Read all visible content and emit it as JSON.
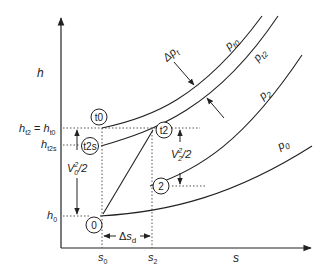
{
  "diagram": {
    "type": "h-s (enthalpy-entropy) diagram, diffuser process",
    "axes": {
      "y_label": "h",
      "x_label": "s"
    },
    "isobars": [
      {
        "id": "pt0",
        "label": "p",
        "sub": "t0"
      },
      {
        "id": "pt2",
        "label": "p",
        "sub": "t2"
      },
      {
        "id": "p2",
        "label": "p",
        "sub": "2"
      },
      {
        "id": "p0",
        "label": "p",
        "sub": "0"
      }
    ],
    "pressure_loss": {
      "label": "Δp",
      "sub": "t"
    },
    "states": [
      {
        "id": "t0",
        "label": "t0"
      },
      {
        "id": "t2s",
        "label": "t2s"
      },
      {
        "id": "t2",
        "label": "t2"
      },
      {
        "id": "2",
        "label": "2"
      },
      {
        "id": "0",
        "label": "0"
      }
    ],
    "h_levels": {
      "ht2_ht0": {
        "h1": "h",
        "s1": "t2",
        "eq": " = ",
        "h2": "h",
        "s2": "t0"
      },
      "ht2s": {
        "h": "h",
        "sub": "t2s"
      },
      "h0": {
        "h": "h",
        "sub": "0"
      }
    },
    "s_levels": {
      "s0": {
        "s": "s",
        "sub": "0"
      },
      "s2": {
        "s": "s",
        "sub": "2"
      }
    },
    "annotations": {
      "v0": {
        "v": "V",
        "sup": "2",
        "sub": "0",
        "rest": "/2"
      },
      "v2": {
        "v": "V",
        "sup": "2",
        "sub": "2",
        "rest": "/2"
      },
      "delta_sd": {
        "delta": "Δ",
        "s": "s",
        "sub": "d"
      }
    }
  }
}
